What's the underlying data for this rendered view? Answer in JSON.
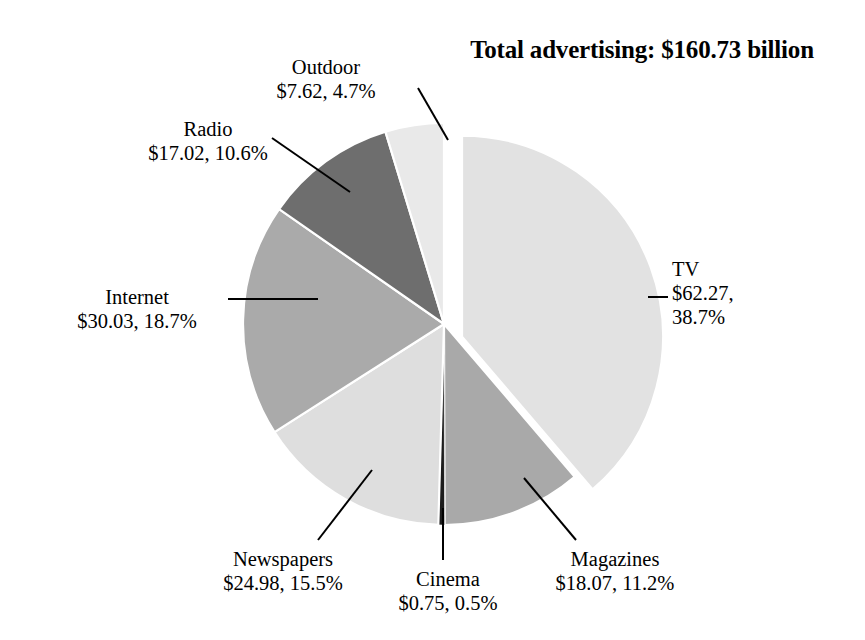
{
  "title": "Total advertising: $160.73 billion",
  "chart_data": {
    "type": "pie",
    "title": "Total advertising: $160.73 billion",
    "total": 160.73,
    "unit": "billion USD",
    "value_prefix": "$",
    "legend_position": "callout-labels",
    "grid": false,
    "categories": [
      "TV",
      "Magazines",
      "Cinema",
      "Newspapers",
      "Internet",
      "Radio",
      "Outdoor"
    ],
    "values": [
      62.27,
      18.07,
      0.75,
      24.98,
      30.03,
      17.02,
      7.62
    ],
    "percentages": [
      38.7,
      11.2,
      0.5,
      15.5,
      18.7,
      10.6,
      4.7
    ],
    "colors": [
      "#e2e2e2",
      "#a9a9a9",
      "#1c1c1c",
      "#dedede",
      "#aaaaaa",
      "#6e6e6e",
      "#e9e9e9"
    ],
    "exploded": [
      "TV"
    ],
    "slices": [
      {
        "name": "TV",
        "label_name": "TV",
        "label_value_line1": "$62.27,",
        "label_value_line2": "38.7%",
        "value": 62.27,
        "percent": 38.7,
        "color": "#e2e2e2",
        "exploded": true
      },
      {
        "name": "Magazines",
        "label_name": "Magazines",
        "label_value": "$18.07, 11.2%",
        "value": 18.07,
        "percent": 11.2,
        "color": "#a9a9a9",
        "exploded": false
      },
      {
        "name": "Cinema",
        "label_name": "Cinema",
        "label_value": "$0.75, 0.5%",
        "value": 0.75,
        "percent": 0.5,
        "color": "#1c1c1c",
        "exploded": false
      },
      {
        "name": "Newspapers",
        "label_name": "Newspapers",
        "label_value": "$24.98, 15.5%",
        "value": 24.98,
        "percent": 15.5,
        "color": "#dedede",
        "exploded": false
      },
      {
        "name": "Internet",
        "label_name": "Internet",
        "label_value": "$30.03, 18.7%",
        "value": 30.03,
        "percent": 18.7,
        "color": "#aaaaaa",
        "exploded": false
      },
      {
        "name": "Radio",
        "label_name": "Radio",
        "label_value": "$17.02, 10.6%",
        "value": 17.02,
        "percent": 10.6,
        "color": "#6e6e6e",
        "exploded": false
      },
      {
        "name": "Outdoor",
        "label_name": "Outdoor",
        "label_value": "$7.62, 4.7%",
        "value": 7.62,
        "percent": 4.7,
        "color": "#e9e9e9",
        "exploded": false
      }
    ]
  },
  "geometry": {
    "center_x": 444,
    "center_y": 324,
    "radius": 201,
    "start_angle_deg": -90,
    "explode_offset": 22,
    "explode_direction_deg": 35
  },
  "leaders": {
    "outdoor": {
      "x1": 418,
      "y1": 88,
      "x2": 448,
      "y2": 140
    },
    "radio": {
      "x1": 272,
      "y1": 138,
      "x2": 350,
      "y2": 192
    },
    "internet": {
      "x1": 228,
      "y1": 299,
      "x2": 318,
      "y2": 299
    },
    "tv": {
      "x1": 648,
      "y1": 297,
      "x2": 668,
      "y2": 297
    },
    "newspapers": {
      "x1": 318,
      "y1": 540,
      "x2": 372,
      "y2": 470
    },
    "cinema": {
      "x1": 443,
      "y1": 560,
      "x2": 443,
      "y2": 508
    },
    "magazines": {
      "x1": 576,
      "y1": 540,
      "x2": 524,
      "y2": 478
    }
  }
}
